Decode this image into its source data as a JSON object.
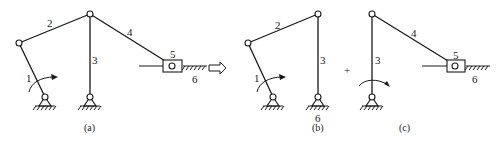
{
  "figure": {
    "operators": {
      "arrow": "⇨",
      "plus": "+"
    },
    "subfigures": [
      {
        "id": "a",
        "caption": "(a)",
        "labels": {
          "link1": "1",
          "link2": "2",
          "link3": "3",
          "link4": "4",
          "slider": "5",
          "frame": "6"
        }
      },
      {
        "id": "b",
        "caption": "(b)",
        "labels": {
          "link1": "1",
          "link2": "2",
          "link3": "3",
          "frame": "6"
        }
      },
      {
        "id": "c",
        "caption": "(c)",
        "labels": {
          "link3": "3",
          "link4": "4",
          "slider": "5",
          "frame": "6"
        }
      }
    ]
  },
  "colors": {
    "ink": "#1a1a1a",
    "background": "#ffffff"
  }
}
